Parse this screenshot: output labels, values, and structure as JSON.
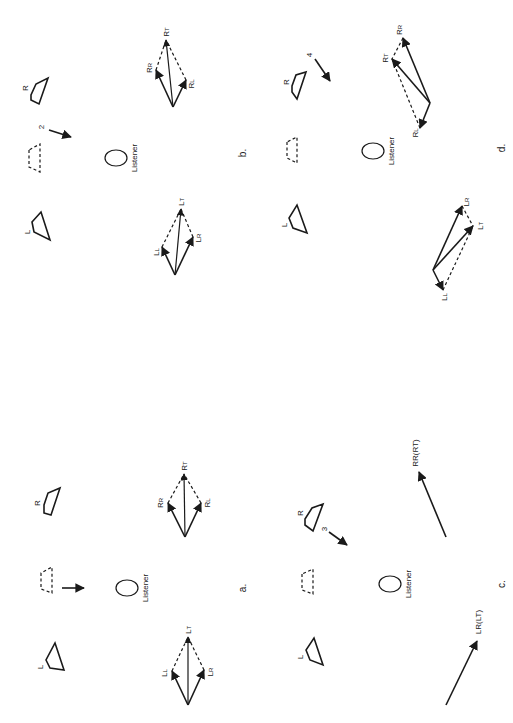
{
  "figure": {
    "orientation": "rotated 90 degrees clockwise",
    "listener_label": "Listener",
    "panels": [
      {
        "id": "a",
        "label": "a.",
        "speakers": {
          "left": "L",
          "right": "R",
          "center_phantom": "dashed"
        },
        "motion_arrow": {
          "number": ""
        },
        "left_vectors": {
          "components": [
            "LL",
            "LR"
          ],
          "total": "LT"
        },
        "right_vectors": {
          "components": [
            "RR",
            "RL"
          ],
          "total": "RT"
        }
      },
      {
        "id": "b",
        "label": "b.",
        "speakers": {
          "left": "L",
          "right": "R",
          "center_phantom": "dashed"
        },
        "motion_arrow": {
          "number": "2"
        },
        "left_vectors": {
          "components": [
            "LL",
            "LR"
          ],
          "total": "LT"
        },
        "right_vectors": {
          "components": [
            "RR",
            "RL"
          ],
          "total": "RT"
        }
      },
      {
        "id": "c",
        "label": "c.",
        "speakers": {
          "left": "L",
          "right": "R",
          "center_phantom": "dashed"
        },
        "motion_arrow": {
          "number": "3"
        },
        "left_vectors": {
          "single": "LR(LT)"
        },
        "right_vectors": {
          "single": "RR(RT)"
        }
      },
      {
        "id": "d",
        "label": "d.",
        "speakers": {
          "left": "L",
          "right": "R",
          "center_phantom": "dashed"
        },
        "motion_arrow": {
          "number": "4"
        },
        "left_vectors": {
          "components": [
            "LL",
            "LR"
          ],
          "total": "LT"
        },
        "right_vectors": {
          "components": [
            "RR",
            "RL"
          ],
          "total": "RT"
        }
      }
    ]
  },
  "labels": {
    "L": "L",
    "R": "R",
    "LL_main": "L",
    "LL_sub": "L",
    "LR_main": "L",
    "LR_sub": "R",
    "LT_main": "L",
    "LT_sub": "T",
    "RR_main": "R",
    "RR_sub": "R",
    "RL_main": "R",
    "RL_sub": "L",
    "RT_main": "R",
    "RT_sub": "T",
    "RR_RT": "RR(RT)",
    "LR_LT": "LR(LT)",
    "num2": "2",
    "num3": "3",
    "num4": "4",
    "a": "a.",
    "b": "b.",
    "c": "c.",
    "d": "d."
  }
}
